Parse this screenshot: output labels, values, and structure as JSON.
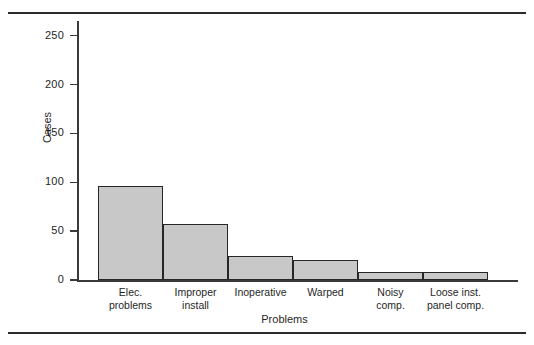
{
  "figure": {
    "top_rule": true,
    "bottom_rule": true
  },
  "chart_data": {
    "type": "bar",
    "title": "",
    "xlabel": "Problems",
    "ylabel": "Cases",
    "categories": [
      "Elec. problems",
      "Improper install",
      "Inoperative",
      "Warped",
      "Noisy comp.",
      "Loose inst. panel comp."
    ],
    "category_lines": [
      [
        "Elec.",
        "problems"
      ],
      [
        "Improper",
        "install"
      ],
      [
        "Inoperative",
        ""
      ],
      [
        "Warped",
        ""
      ],
      [
        "Noisy",
        "comp."
      ],
      [
        "Loose inst.",
        "panel comp."
      ]
    ],
    "values": [
      96,
      57,
      25,
      20,
      8,
      8
    ],
    "ylim": [
      0,
      265
    ],
    "yticks": [
      0,
      50,
      100,
      150,
      200,
      250
    ],
    "ytick_labels": [
      "0",
      "50",
      "100",
      "150",
      "200",
      "250"
    ],
    "grid": false,
    "legend": null,
    "bar_fill": "#c8c8c8",
    "bar_edge": "#262626"
  }
}
